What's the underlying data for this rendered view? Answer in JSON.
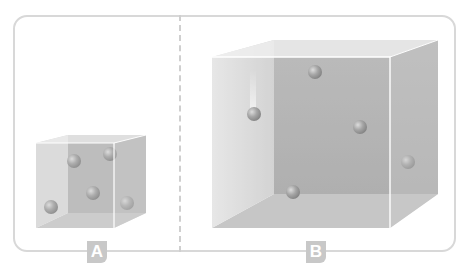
{
  "diagram": {
    "title": "",
    "panels": [
      {
        "label": "A",
        "description": "small container with gas particles",
        "particle_count": 5
      },
      {
        "label": "B",
        "description": "large container with gas particles",
        "particle_count": 5
      }
    ],
    "colors": {
      "frame": "#d8d8d8",
      "divider": "#cfcfcf",
      "label_bg": "#c8c8c8",
      "label_text": "#ffffff",
      "box_back": "#a8a8a8",
      "box_side": "#c4c4c4",
      "box_front": "#dcdcdc",
      "particle": "#8a8a8a"
    }
  }
}
